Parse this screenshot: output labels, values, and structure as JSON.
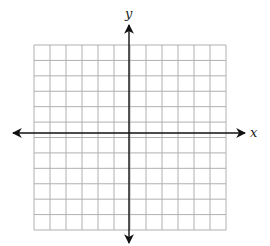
{
  "diagram": {
    "type": "coordinate-plane",
    "x_axis_label": "x",
    "y_axis_label": "y",
    "grid": {
      "columns": 12,
      "rows": 12,
      "left": 34,
      "top": 45,
      "right": 226,
      "bottom": 230,
      "line_color": "#b0b0b0"
    },
    "axes": {
      "color": "#111111",
      "x_axis_y": 133,
      "y_axis_x": 129,
      "x_start": 13,
      "x_end": 245,
      "y_start": 25,
      "y_end": 243
    }
  }
}
